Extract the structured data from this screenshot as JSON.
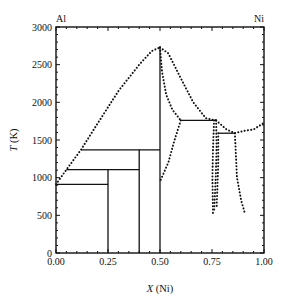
{
  "chart_data": {
    "type": "line",
    "title": "",
    "xlabel": "X (Ni)",
    "xlabel_italic_part": "X",
    "xlabel_rest": " (Ni)",
    "ylabel": "T (K)",
    "ylabel_italic_part": "T",
    "ylabel_rest": " (K)",
    "xlim": [
      0,
      1
    ],
    "ylim": [
      0,
      3000
    ],
    "x_ticks": [
      0,
      0.25,
      0.5,
      0.75,
      1.0
    ],
    "x_tick_labels": [
      "0.00",
      "0.25",
      "0.50",
      "0.75",
      "1.00"
    ],
    "y_ticks": [
      0,
      500,
      1000,
      1500,
      2000,
      2500,
      3000
    ],
    "y_tick_labels": [
      "0",
      "500",
      "1000",
      "1500",
      "2000",
      "2500",
      "3000"
    ],
    "corner_labels": {
      "left": "Al",
      "right": "Ni"
    },
    "grid": false,
    "legend": "none",
    "solid_lines": [
      {
        "name": "eutectic-912",
        "points": [
          [
            0.0,
            912
          ],
          [
            0.25,
            912
          ]
        ]
      },
      {
        "name": "peritectic-1106",
        "points": [
          [
            0.05,
            1106
          ],
          [
            0.4,
            1106
          ]
        ]
      },
      {
        "name": "peritectic-1370",
        "points": [
          [
            0.12,
            1370
          ],
          [
            0.5,
            1370
          ]
        ]
      },
      {
        "name": "peritectic-1760",
        "points": [
          [
            0.6,
            1760
          ],
          [
            0.77,
            1760
          ]
        ]
      },
      {
        "name": "peritectic-1590",
        "points": [
          [
            0.78,
            1590
          ],
          [
            0.86,
            1590
          ]
        ]
      },
      {
        "name": "compound-0.25",
        "points": [
          [
            0.25,
            0
          ],
          [
            0.25,
            1106
          ]
        ]
      },
      {
        "name": "compound-0.40",
        "points": [
          [
            0.4,
            0
          ],
          [
            0.4,
            1370
          ]
        ]
      },
      {
        "name": "compound-0.50",
        "points": [
          [
            0.5,
            0
          ],
          [
            0.5,
            2730
          ]
        ]
      }
    ],
    "dotted_series": [
      {
        "name": "liquidus-left",
        "points": [
          [
            0.0,
            912
          ],
          [
            0.05,
            1106
          ],
          [
            0.12,
            1370
          ],
          [
            0.2,
            1720
          ],
          [
            0.3,
            2150
          ],
          [
            0.4,
            2500
          ],
          [
            0.46,
            2680
          ],
          [
            0.5,
            2730
          ]
        ]
      },
      {
        "name": "liquidus-right",
        "points": [
          [
            0.5,
            2730
          ],
          [
            0.54,
            2650
          ],
          [
            0.6,
            2320
          ],
          [
            0.66,
            2000
          ],
          [
            0.72,
            1790
          ],
          [
            0.77,
            1760
          ]
        ]
      },
      {
        "name": "liquidus-ni",
        "points": [
          [
            0.77,
            1760
          ],
          [
            0.82,
            1640
          ],
          [
            0.86,
            1590
          ],
          [
            0.9,
            1620
          ],
          [
            0.95,
            1640
          ],
          [
            1.0,
            1728
          ]
        ]
      },
      {
        "name": "b2-boundary-left",
        "points": [
          [
            0.5,
            2730
          ],
          [
            0.51,
            2400
          ],
          [
            0.53,
            2100
          ],
          [
            0.56,
            1900
          ],
          [
            0.6,
            1760
          ]
        ]
      },
      {
        "name": "b2-boundary-lower",
        "points": [
          [
            0.6,
            1760
          ],
          [
            0.57,
            1500
          ],
          [
            0.54,
            1200
          ],
          [
            0.5,
            950
          ]
        ]
      },
      {
        "name": "ni3al-left",
        "points": [
          [
            0.76,
            1760
          ],
          [
            0.755,
            1400
          ],
          [
            0.752,
            1000
          ],
          [
            0.755,
            500
          ]
        ]
      },
      {
        "name": "ni3al-right",
        "points": [
          [
            0.77,
            1760
          ],
          [
            0.772,
            1400
          ],
          [
            0.768,
            1000
          ],
          [
            0.76,
            550
          ]
        ]
      },
      {
        "name": "ni3al-inner",
        "points": [
          [
            0.78,
            1590
          ],
          [
            0.78,
            1200
          ],
          [
            0.775,
            800
          ],
          [
            0.772,
            600
          ]
        ]
      },
      {
        "name": "ni-solvus",
        "points": [
          [
            0.86,
            1590
          ],
          [
            0.865,
            1300
          ],
          [
            0.87,
            1000
          ],
          [
            0.89,
            700
          ],
          [
            0.91,
            510
          ]
        ]
      }
    ]
  }
}
